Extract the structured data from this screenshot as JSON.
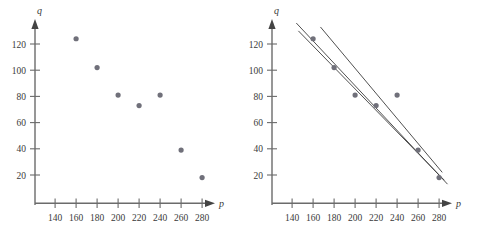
{
  "figure": {
    "background_color": "#ffffff",
    "axis_color": "#6b6b6b",
    "point_color": "#70707a",
    "line_color": "#3c3c3c",
    "tick_label_color": "#3a3a3a"
  },
  "panels": [
    {
      "id": "scatter-panel",
      "name": "scatter-plot",
      "chart_data": {
        "type": "scatter",
        "title": "",
        "xlabel": "p",
        "ylabel": "q",
        "xlim": [
          130,
          295
        ],
        "ylim": [
          0,
          135
        ],
        "grid": false,
        "legend": "none",
        "xticks": [
          140,
          160,
          180,
          200,
          220,
          240,
          260,
          280
        ],
        "yticks": [
          20,
          40,
          60,
          80,
          100,
          120
        ],
        "xtick_labels": [
          "140",
          "160",
          "180",
          "200",
          "220",
          "240",
          "260",
          "280"
        ],
        "ytick_labels": [
          "20",
          "40",
          "60",
          "80",
          "100",
          "120"
        ],
        "series": [
          {
            "name": "observations",
            "x": [
              160,
              180,
              200,
              220,
              240,
              260,
              280
            ],
            "y": [
              124,
              102,
              81,
              73,
              81,
              39,
              18
            ]
          }
        ]
      }
    },
    {
      "id": "fitted-panel",
      "name": "scatter-plot-with-fitted-lines",
      "chart_data": {
        "type": "scatter",
        "title": "",
        "xlabel": "p",
        "ylabel": "q",
        "xlim": [
          130,
          295
        ],
        "ylim": [
          0,
          135
        ],
        "grid": false,
        "legend": "none",
        "xticks": [
          140,
          160,
          180,
          200,
          220,
          240,
          260,
          280
        ],
        "yticks": [
          20,
          40,
          60,
          80,
          100,
          120
        ],
        "xtick_labels": [
          "140",
          "160",
          "180",
          "200",
          "220",
          "240",
          "260",
          "280"
        ],
        "ytick_labels": [
          "20",
          "40",
          "60",
          "80",
          "100",
          "120"
        ],
        "series": [
          {
            "name": "observations",
            "x": [
              160,
              180,
              200,
              220,
              240,
              260,
              280
            ],
            "y": [
              124,
              102,
              81,
              73,
              81,
              39,
              18
            ]
          }
        ],
        "fitted_lines": [
          {
            "name": "line-1",
            "x_start": 144,
            "y_start": 136,
            "x_end": 288,
            "y_end": 13
          },
          {
            "name": "line-2",
            "x_start": 146,
            "y_start": 130,
            "x_end": 285,
            "y_end": 16
          },
          {
            "name": "line-3",
            "x_start": 167,
            "y_start": 133,
            "x_end": 283,
            "y_end": 22
          }
        ]
      }
    }
  ]
}
